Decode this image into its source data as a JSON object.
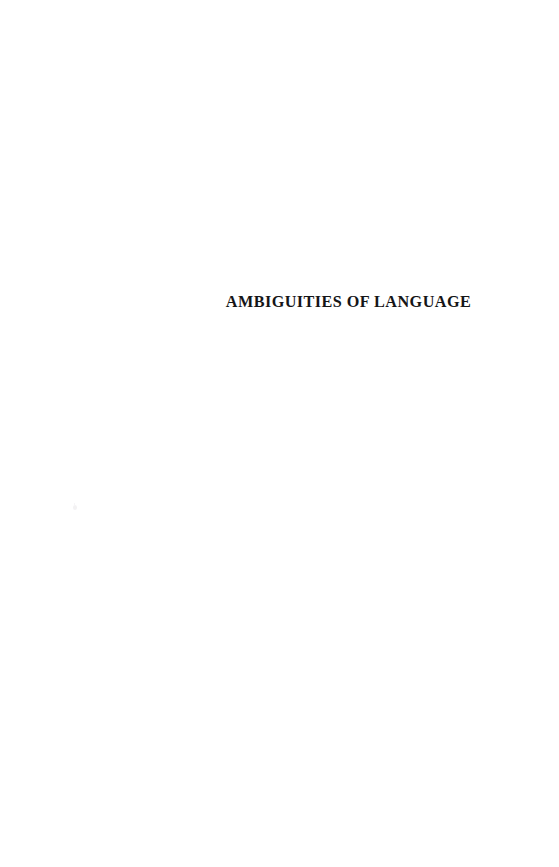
{
  "document": {
    "type": "half-title-page",
    "page_background_color": "#ffffff",
    "text_color": "#151517"
  },
  "halftitle": {
    "text": "AMBIGUITIES OF LANGUAGE"
  },
  "artifacts": {
    "speck_label": ""
  }
}
